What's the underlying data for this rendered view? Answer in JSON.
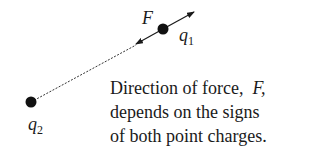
{
  "diagram": {
    "force_label": "F",
    "charge1": {
      "symbol": "q",
      "subscript": "1"
    },
    "charge2": {
      "symbol": "q",
      "subscript": "2"
    },
    "caption": {
      "line1_prefix": "Direction of force,",
      "line1_var": "F,",
      "line2": "depends on the signs",
      "line3": "of both point charges."
    },
    "colors": {
      "ink": "#1a1a1a",
      "background": "#ffffff"
    }
  }
}
